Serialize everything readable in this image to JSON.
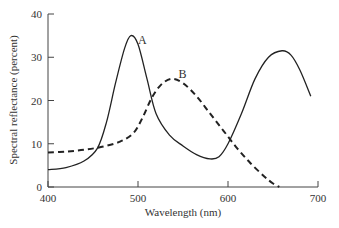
{
  "chart_data": {
    "type": "line",
    "title": "",
    "xlabel": "Wavelength (nm)",
    "ylabel": "Spectral reflectance (percent)",
    "xlim": [
      400,
      700
    ],
    "ylim": [
      0,
      40
    ],
    "xticks": [
      "400",
      "500",
      "600",
      "700"
    ],
    "yticks": [
      "0",
      "10",
      "20",
      "30",
      "40"
    ],
    "grid": false,
    "legend": "none (curves labeled inline A and B)",
    "series": [
      {
        "name": "A",
        "style": "solid",
        "x": [
          400,
          420,
          440,
          455,
          465,
          475,
          485,
          492,
          500,
          510,
          520,
          535,
          550,
          565,
          580,
          590,
          600,
          615,
          630,
          645,
          660,
          670,
          680,
          692
        ],
        "y": [
          4,
          4.5,
          6,
          9,
          15,
          24,
          32,
          35,
          33,
          25,
          17,
          12,
          9.5,
          7.5,
          6.5,
          7,
          10,
          17,
          25,
          30,
          31.5,
          30.5,
          27,
          21
        ]
      },
      {
        "name": "B",
        "style": "dashed",
        "x": [
          400,
          420,
          440,
          460,
          480,
          495,
          505,
          515,
          525,
          537,
          550,
          565,
          580,
          595,
          610,
          625,
          640,
          650,
          657
        ],
        "y": [
          8,
          8.2,
          8.6,
          9.3,
          10.5,
          12.5,
          16,
          20.5,
          23.5,
          25,
          24,
          21,
          17,
          13,
          9,
          5.5,
          2.5,
          0.8,
          0
        ]
      }
    ],
    "annotations": [
      {
        "text": "A",
        "x": 500,
        "y": 35
      },
      {
        "text": "B",
        "x": 545,
        "y": 27
      }
    ]
  }
}
